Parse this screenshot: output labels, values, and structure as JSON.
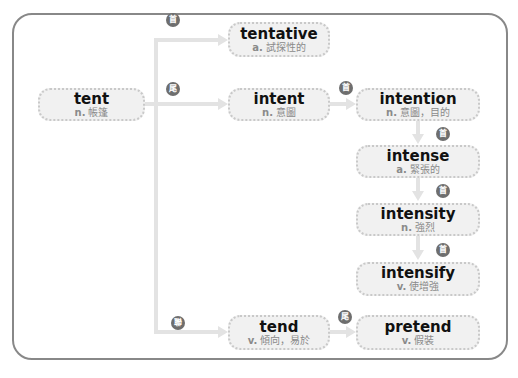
{
  "caption": "",
  "colors": {
    "frame": "#888888",
    "box_fill": "#f1f1f1",
    "box_border": "#c9c9c9",
    "connector": "#e3e3e3",
    "badge": "#6e6e6e",
    "word": "#111111",
    "definition": "#8a8a8a"
  },
  "nodes": {
    "tent": {
      "word": "tent",
      "pos": "n.",
      "meaning": "帳篷"
    },
    "tentative": {
      "word": "tentative",
      "pos": "a.",
      "meaning": "試探性的"
    },
    "intent": {
      "word": "intent",
      "pos": "n.",
      "meaning": "意圖"
    },
    "intention": {
      "word": "intention",
      "pos": "n.",
      "meaning": "意圖，目的"
    },
    "intense": {
      "word": "intense",
      "pos": "a.",
      "meaning": "緊張的"
    },
    "intensity": {
      "word": "intensity",
      "pos": "n.",
      "meaning": "強烈"
    },
    "intensify": {
      "word": "intensify",
      "pos": "v.",
      "meaning": "使增強"
    },
    "tend": {
      "word": "tend",
      "pos": "v.",
      "meaning": "傾向，易於"
    },
    "pretend": {
      "word": "pretend",
      "pos": "v.",
      "meaning": "假裝"
    }
  },
  "badges": {
    "tent_to_tentative": "首",
    "tent_to_intent": "尾",
    "tent_to_tend": "聯",
    "intent_to_intention": "首",
    "intention_to_intense": "首",
    "intense_to_intensity": "首",
    "intensity_to_intensify": "首",
    "tend_to_pretend": "尾"
  }
}
